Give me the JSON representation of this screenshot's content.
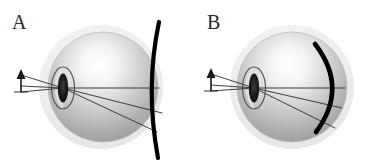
{
  "figure": {
    "width": 378,
    "height": 167,
    "background": "#ffffff",
    "panel_count": 2
  },
  "panels": [
    {
      "label": "A",
      "name": "panel-a",
      "description": "Schematic eye with arrow object at left, rays refracting through lens onto a forward-bulging image surface",
      "image_surface": {
        "shape": "arc",
        "curvature": "convex-left",
        "color": "#000000",
        "stroke_width": 4.2,
        "continuous": true
      }
    },
    {
      "label": "B",
      "name": "panel-b",
      "description": "Schematic eye with arrow object at left, rays refracting through lens onto a concave image surface inside the globe",
      "image_surface": {
        "shape": "arc",
        "curvature": "concave-left",
        "color": "#000000",
        "stroke_width": 4.6,
        "continuous": false
      }
    }
  ],
  "eye": {
    "globe_fill_light": "#fefefe",
    "globe_fill_mid": "#c9c9c9",
    "globe_fill_dark": "#9a9a9a",
    "halo_fill": "#ebebeb",
    "lens_fill": "#1a1a1a",
    "lens_outline": "#4a4a4a",
    "ray_color": "#2a2a2a",
    "ray_width": 0.9,
    "ray_count": 3
  },
  "object": {
    "kind": "arrow",
    "color": "#1a1a1a",
    "orientation": "up"
  },
  "colors": {
    "ink": "#2b2b2b",
    "paper": "#ffffff"
  }
}
